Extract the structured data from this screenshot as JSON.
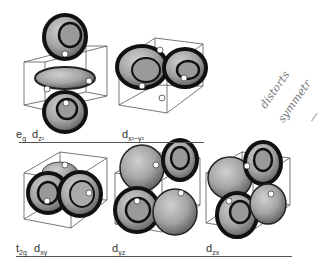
{
  "figure": {
    "rows": [
      {
        "set_label": "e",
        "set_sub": "g",
        "orbitals": [
          {
            "label": "d",
            "sub": "z²"
          },
          {
            "label": "d",
            "sub": "x²−y²"
          }
        ]
      },
      {
        "set_label": "t",
        "set_sub": "2g",
        "orbitals": [
          {
            "label": "d",
            "sub": "xy"
          },
          {
            "label": "d",
            "sub": "yz"
          },
          {
            "label": "d",
            "sub": "zx"
          }
        ]
      }
    ],
    "annotation": {
      "line1": "distorts",
      "line2": "symmetr",
      "line3": "—"
    },
    "colors": {
      "lobe_fill": "#a9a9a9",
      "lobe_dark": "#1a1a1a",
      "lobe_light": "#c8c8c8",
      "cube_line": "#555555",
      "ligand_fill": "#ffffff"
    }
  }
}
